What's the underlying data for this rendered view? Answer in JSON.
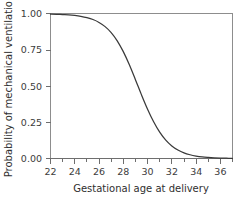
{
  "chart_data": {
    "type": "line",
    "title": "",
    "xlabel": "Gestational age at delivery",
    "ylabel": "Probability of mechanical ventilation",
    "xlim": [
      22,
      37
    ],
    "ylim": [
      0.0,
      1.0
    ],
    "grid": false,
    "legend": null,
    "x_major_ticks": [
      22,
      24,
      26,
      28,
      30,
      32,
      34,
      36
    ],
    "x_minor_ticks": [
      23,
      25,
      27,
      29,
      31,
      33,
      35,
      37
    ],
    "x_ticklabels": [
      "22",
      "24",
      "26",
      "28",
      "30",
      "32",
      "34",
      "36"
    ],
    "y_major_ticks": [
      0.0,
      0.25,
      0.5,
      0.75,
      1.0
    ],
    "y_ticklabels": [
      "0.00",
      "0.25",
      "0.50",
      "0.75",
      "1.00"
    ],
    "series": [
      {
        "name": "Probability of mechanical ventilation",
        "color": "#3a3a3a",
        "x": [
          22.0,
          22.5,
          23.0,
          23.5,
          24.0,
          24.5,
          25.0,
          25.5,
          26.0,
          26.5,
          27.0,
          27.5,
          28.0,
          28.5,
          29.0,
          29.5,
          30.0,
          30.5,
          31.0,
          31.5,
          32.0,
          32.5,
          33.0,
          33.5,
          34.0,
          34.5,
          35.0,
          35.5,
          36.0,
          36.5,
          37.0
        ],
        "y": [
          0.998,
          0.997,
          0.995,
          0.993,
          0.989,
          0.983,
          0.974,
          0.961,
          0.941,
          0.912,
          0.871,
          0.814,
          0.739,
          0.648,
          0.545,
          0.44,
          0.341,
          0.254,
          0.182,
          0.127,
          0.087,
          0.059,
          0.039,
          0.026,
          0.017,
          0.011,
          0.0074,
          0.0048,
          0.0031,
          0.002,
          0.0013
        ]
      }
    ],
    "midpoint": {
      "x": 29.0,
      "y": 0.5
    },
    "colors": {
      "curve": "#3a3a3a",
      "axis": "#6e6e6e",
      "text": "#3c3c3c",
      "background": "#ffffff"
    }
  }
}
